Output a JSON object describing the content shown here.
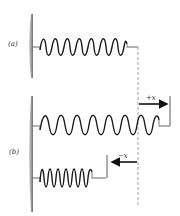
{
  "figure": {
    "panels": [
      {
        "id": "a",
        "label": "(a)",
        "state": "equilibrium"
      },
      {
        "id": "b",
        "label": "(b)",
        "states": [
          "stretched",
          "compressed"
        ]
      }
    ],
    "arrows": {
      "positive": {
        "label": "+x",
        "direction": "right"
      },
      "negative": {
        "label": "−x",
        "direction": "left"
      }
    },
    "colors": {
      "wall": "#8a8a8a",
      "spring_dark": "#1a1a1a",
      "spring_light": "#9a9a9a",
      "dashed_line": "#888888",
      "arrow": "#111111"
    }
  }
}
